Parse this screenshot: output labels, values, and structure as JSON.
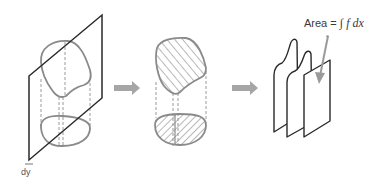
{
  "diagram": {
    "steps": [
      {
        "id": "solid-with-plane",
        "description": "3D solid cut by a slicing plane of thickness dy"
      },
      {
        "id": "hatched-solid",
        "description": "Solid with hatched cross-sections (top surface and base region)"
      },
      {
        "id": "stacked-slices",
        "description": "Stacked slice cross-sections"
      }
    ],
    "labels": {
      "area_prefix": "Area = ",
      "integral_symbol": "∫",
      "integrand": "f dx",
      "lower_limit": "a",
      "thickness": "dy"
    },
    "arrows": [
      {
        "from": "solid-with-plane",
        "to": "hatched-solid"
      },
      {
        "from": "hatched-solid",
        "to": "stacked-slices"
      }
    ],
    "colors": {
      "outline": "#8a8a8a",
      "plane": "#2a2a2a",
      "arrow": "#a6a6a6",
      "hatch": "#8a8a8a",
      "background": "#ffffff"
    }
  }
}
